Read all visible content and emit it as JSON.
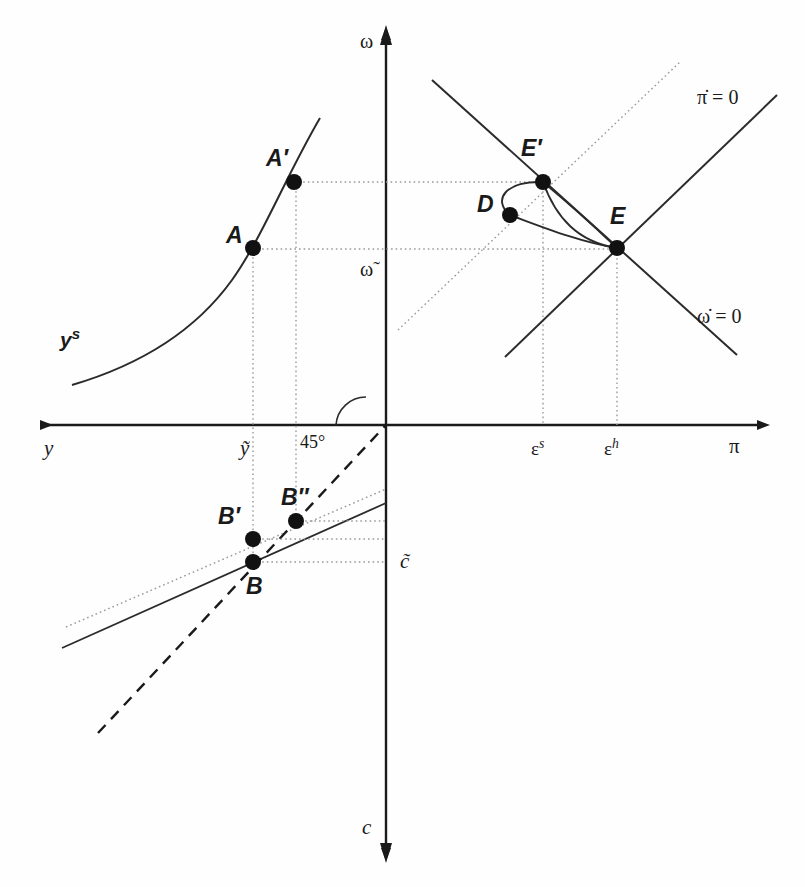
{
  "figure": {
    "type": "economics-phase-diagram"
  },
  "axes": {
    "left_label": "y",
    "right_label": "π",
    "top_label": "ω",
    "bottom_label": "c",
    "origin": {
      "x": 386,
      "y": 425
    }
  },
  "ticks": {
    "y_tilde": "ỹ",
    "omega_tilde": "ω̃",
    "c_tilde": "c̃",
    "epsilon_s": "ε",
    "epsilon_s_sup": "s",
    "epsilon_h": "ε",
    "epsilon_h_sup": "h"
  },
  "curves": {
    "ys_label": "y",
    "ys_sup": "s",
    "pidot_label": "π̇ = 0",
    "omegadot_label": "ω̇ = 0",
    "angle_label": "45°"
  },
  "points": [
    {
      "id": "A",
      "label": "A",
      "x": 253,
      "y": 248,
      "lx": 226,
      "ly": 222
    },
    {
      "id": "Aprime",
      "label": "A′",
      "x": 294,
      "y": 182,
      "lx": 266,
      "ly": 145
    },
    {
      "id": "Eprime",
      "label": "E′",
      "x": 543,
      "y": 182,
      "lx": 521,
      "ly": 135
    },
    {
      "id": "D",
      "label": "D",
      "x": 510,
      "y": 215,
      "lx": 477,
      "ly": 191
    },
    {
      "id": "E",
      "label": "E",
      "x": 617,
      "y": 248,
      "lx": 610,
      "ly": 203
    },
    {
      "id": "Bprime",
      "label": "B′",
      "x": 253,
      "y": 539,
      "lx": 218,
      "ly": 503
    },
    {
      "id": "B",
      "label": "B",
      "x": 253,
      "y": 562,
      "lx": 246,
      "ly": 573
    },
    {
      "id": "Bdprime",
      "label": "B″",
      "x": 296,
      "y": 521,
      "lx": 281,
      "ly": 484
    }
  ],
  "colors": {
    "ink": "#1a1a1a",
    "line": "#2b2b2b",
    "dotted": "#9a9a9a",
    "background": "#fefefe"
  }
}
